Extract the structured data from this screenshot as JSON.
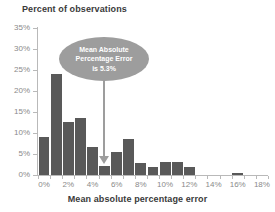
{
  "chart_data": {
    "type": "bar",
    "title": "Percent of observations",
    "xlabel": "Mean absolute percentage error",
    "ylabel": "Percent of observations",
    "grid": false,
    "legend": null,
    "xlim": [
      0,
      19
    ],
    "ylim": [
      0,
      35
    ],
    "y_tick_labels": [
      "0%",
      "5%",
      "10%",
      "15%",
      "20%",
      "25%",
      "30%",
      "35%"
    ],
    "y_tick_values": [
      0,
      5,
      10,
      15,
      20,
      25,
      30,
      35
    ],
    "x_tick_labels": [
      "0%",
      "2%",
      "4%",
      "6%",
      "8%",
      "10%",
      "12%",
      "14%",
      "16%",
      "18%"
    ],
    "x_tick_values": [
      0,
      2,
      4,
      6,
      8,
      10,
      12,
      14,
      16,
      18
    ],
    "bin_width": 1,
    "categories": [
      "0%",
      "1%",
      "2%",
      "3%",
      "4%",
      "5%",
      "6%",
      "7%",
      "8%",
      "9%",
      "10%",
      "11%",
      "12%",
      "13%",
      "14%",
      "15%",
      "16%",
      "17%",
      "18%"
    ],
    "values": [
      9.0,
      24.1,
      12.7,
      13.5,
      6.7,
      2.1,
      5.5,
      8.5,
      2.8,
      2.0,
      3.1,
      3.1,
      2.0,
      0,
      0,
      0,
      0.4,
      0,
      0
    ],
    "bar_color": "#595959",
    "annotations": [
      {
        "name": "mean-absolute-percentage-error-callout",
        "text": "Mean Absolute Percentage Error is 5.3%",
        "lines": [
          "Mean Absolute",
          "Percentage Error",
          "is 5.3%"
        ],
        "value": 5.3,
        "shape": "ellipse",
        "fill": "#9d9d9d",
        "text_color": "#ffffff",
        "pointer": "down-arrow"
      }
    ]
  },
  "annotation_lines": {
    "line1": "Mean Absolute",
    "line2": "Percentage Error",
    "line3": "is 5.3%"
  }
}
